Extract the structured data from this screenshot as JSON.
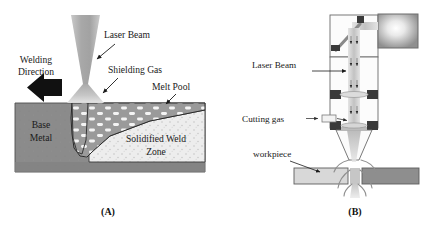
{
  "figure": {
    "background_color": "#ffffff",
    "width": 433,
    "height": 236,
    "panels": [
      {
        "id": "panel-a",
        "caption": "(A)",
        "title_concept": "Laser Welding Schematic",
        "labels": [
          {
            "name": "welding-direction",
            "text_line1": "Welding",
            "text_line2": "Direction"
          },
          {
            "name": "laser-beam",
            "text": "Laser Beam"
          },
          {
            "name": "shielding-gas",
            "text": "Shielding Gas"
          },
          {
            "name": "melt-pool",
            "text": "Melt Pool"
          },
          {
            "name": "base-metal",
            "text_line1": "Base",
            "text_line2": "Metal"
          },
          {
            "name": "solidified-weld-zone",
            "text_line1": "Solidified Weld",
            "text_line2": "Zone"
          }
        ],
        "colors": {
          "base_metal": "#8b8b8b",
          "base_metal_edge": "#5e5e5e",
          "melt_pool": "#9a9a9a",
          "melt_pool_dots": "#f2f2f2",
          "solidified_zone": "#ededed",
          "beam": "#b4b4b4",
          "plume": "#bcbcbc",
          "arrow": "#111111",
          "outline": "#222222"
        }
      },
      {
        "id": "panel-b",
        "caption": "(B)",
        "title_concept": "Laser Cutting Head Schematic",
        "labels": [
          {
            "name": "laser-beam",
            "text": "Laser Beam"
          },
          {
            "name": "cutting-gas",
            "text": "Cutting gas"
          },
          {
            "name": "workpiece",
            "text": "workpiece"
          }
        ],
        "colors": {
          "housing_fill": "#fbfbfb",
          "housing_edge": "#6a6a6a",
          "beam": "#cfcfcf",
          "mirror": "#8a8a8a",
          "mount_block": "#3a3a3a",
          "source_glow": "#f4f4f4",
          "source_frame": "#6d6d6d",
          "workpiece_left": "#d8d8d8",
          "workpiece_right": "#8e8e8e",
          "melt_spray": "#bdbdbd"
        }
      }
    ]
  }
}
